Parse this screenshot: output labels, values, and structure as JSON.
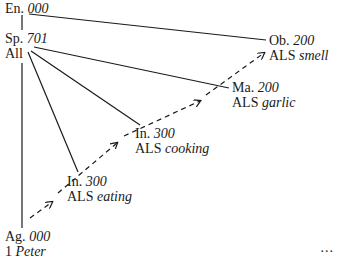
{
  "diagram": {
    "nodes": [
      {
        "id": "en",
        "abbr": "En.",
        "num": "000",
        "sub_prefix": "",
        "sub_italic": ""
      },
      {
        "id": "sp",
        "abbr": "Sp.",
        "num": "701",
        "sub_prefix": "All",
        "sub_italic": ""
      },
      {
        "id": "ob",
        "abbr": "Ob.",
        "num": "200",
        "sub_prefix": "ALS ",
        "sub_italic": "smell"
      },
      {
        "id": "ma",
        "abbr": "Ma.",
        "num": "200",
        "sub_prefix": "ALS ",
        "sub_italic": "garlic"
      },
      {
        "id": "in1",
        "abbr": "In.",
        "num": "300",
        "sub_prefix": "ALS ",
        "sub_italic": "cooking"
      },
      {
        "id": "in2",
        "abbr": "In.",
        "num": "300",
        "sub_prefix": "ALS ",
        "sub_italic": "eating"
      },
      {
        "id": "ag",
        "abbr": "Ag.",
        "num": "000",
        "sub_prefix": "1 ",
        "sub_italic": "Peter"
      }
    ],
    "solid_edges": [
      [
        "en",
        "sp"
      ],
      [
        "en",
        "ob"
      ],
      [
        "sp",
        "ma"
      ],
      [
        "sp",
        "in1"
      ],
      [
        "sp",
        "in2"
      ],
      [
        "sp",
        "ag"
      ]
    ],
    "dashed_arrows": [
      [
        "ag",
        "in2"
      ],
      [
        "in2",
        "in1"
      ],
      [
        "in1",
        "ma"
      ],
      [
        "ma",
        "ob"
      ]
    ],
    "ellipsis": "..."
  }
}
